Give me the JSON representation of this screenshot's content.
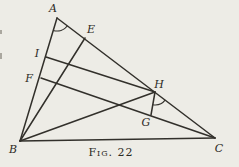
{
  "figure": {
    "caption": "Fig. 22"
  },
  "diagram": {
    "background": "#edece6",
    "stroke": "#32302b",
    "label_color": "#2c2a25",
    "stroke_width": 1.5,
    "arc_stroke_width": 1.1,
    "label_font_size": 11,
    "points": {
      "A": {
        "x": 57,
        "y": 18
      },
      "B": {
        "x": 20,
        "y": 141
      },
      "C": {
        "x": 215,
        "y": 138
      },
      "E": {
        "x": 85,
        "y": 38
      },
      "I": {
        "x": 46,
        "y": 57
      },
      "F": {
        "x": 41,
        "y": 78
      },
      "H": {
        "x": 155,
        "y": 92
      },
      "G": {
        "x": 151,
        "y": 115
      }
    },
    "edges": [
      {
        "from": "A",
        "to": "B"
      },
      {
        "from": "A",
        "to": "C"
      },
      {
        "from": "B",
        "to": "C"
      },
      {
        "from": "B",
        "to": "E"
      },
      {
        "from": "B",
        "to": "H"
      },
      {
        "from": "I",
        "to": "H"
      },
      {
        "from": "F",
        "to": "C"
      },
      {
        "from": "H",
        "to": "G"
      }
    ],
    "angle_marks": [
      {
        "at": "A",
        "from": "B",
        "to": "C",
        "radius": 13
      },
      {
        "at": "H",
        "from": "G",
        "to": "C",
        "radius": 13
      }
    ],
    "labels": [
      {
        "text": "A",
        "x": 53,
        "y": 12
      },
      {
        "text": "E",
        "x": 91,
        "y": 33
      },
      {
        "text": "I",
        "x": 37,
        "y": 57
      },
      {
        "text": "F",
        "x": 29,
        "y": 82
      },
      {
        "text": "H",
        "x": 159,
        "y": 88
      },
      {
        "text": "G",
        "x": 146,
        "y": 126
      },
      {
        "text": "B",
        "x": 13,
        "y": 153
      },
      {
        "text": "C",
        "x": 219,
        "y": 152
      }
    ],
    "scan_marks": [
      {
        "x": 0,
        "y": 30,
        "w": 2,
        "h": 4
      },
      {
        "x": 0,
        "y": 53,
        "w": 2,
        "h": 6
      }
    ]
  }
}
